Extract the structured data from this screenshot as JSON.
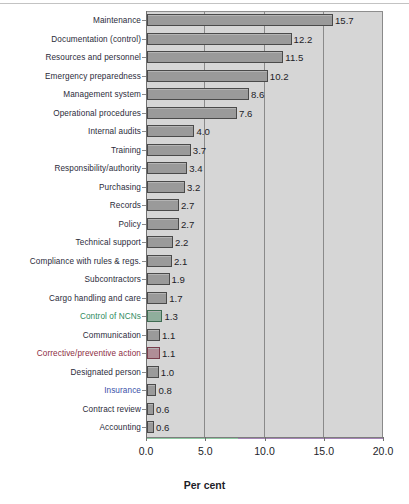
{
  "chart_data": {
    "type": "bar",
    "orientation": "horizontal",
    "title": "",
    "xlabel": "Per cent",
    "ylabel": "",
    "xlim": [
      0.0,
      20.0
    ],
    "xticks": [
      "0.0",
      "5.0",
      "10.0",
      "15.0",
      "20.0"
    ],
    "xtick_values": [
      0.0,
      5.0,
      10.0,
      15.0,
      20.0
    ],
    "grid": true,
    "legend": "none",
    "categories": [
      "Maintenance",
      "Documentation (control)",
      "Resources and personnel",
      "Emergency preparedness",
      "Management system",
      "Operational procedures",
      "Internal audits",
      "Training",
      "Responsibility/authority",
      "Purchasing",
      "Records",
      "Policy",
      "Technical support",
      "Compliance with rules & regs.",
      "Subcontractors",
      "Cargo handling and care",
      "Control of NCNs",
      "Communication",
      "Corrective/preventive action",
      "Designated person",
      "Insurance",
      "Contract review",
      "Accounting"
    ],
    "values": [
      15.7,
      12.2,
      11.5,
      10.2,
      8.6,
      7.6,
      4.0,
      3.7,
      3.4,
      3.2,
      2.7,
      2.7,
      2.2,
      2.1,
      1.9,
      1.7,
      1.3,
      1.1,
      1.1,
      1.0,
      0.8,
      0.6,
      0.6
    ],
    "value_labels": [
      "15.7",
      "12.2",
      "11.5",
      "10.2",
      "8.6",
      "7.6",
      "4.0",
      "3.7",
      "3.4",
      "3.2",
      "2.7",
      "2.7",
      "2.2",
      "2.1",
      "1.9",
      "1.7",
      "1.3",
      "1.1",
      "1.1",
      "1.0",
      "0.8",
      "0.6",
      "0.6"
    ],
    "label_colors": [
      "#2b2b3a",
      "#2b2b3a",
      "#2b2b3a",
      "#2b2b3a",
      "#2b2b3a",
      "#2b2b3a",
      "#2b2b3a",
      "#2b2b3a",
      "#2b2b3a",
      "#2b2b3a",
      "#2b2b3a",
      "#2b2b3a",
      "#2b2b3a",
      "#2b2b3a",
      "#2b2b3a",
      "#2b2b3a",
      "#2f8a5e",
      "#2b2b3a",
      "#8c2d3f",
      "#2b2b3a",
      "#3a4fa8",
      "#2b2b3a",
      "#2b2b3a"
    ],
    "bar_tints": [
      "",
      "",
      "",
      "",
      "",
      "",
      "",
      "",
      "",
      "",
      "",
      "",
      "",
      "",
      "",
      "",
      "green-tint",
      "",
      "red-tint",
      "",
      "",
      "",
      ""
    ],
    "colors": {
      "bar_fill": "#9a9a9a",
      "bar_border": "#4a4a4a",
      "plot_background": "#d6d6d6",
      "page_background": "#ffffff",
      "gridline": "#8a8a8a",
      "text": "#1d1d28",
      "accent_green": "#2f8a5e",
      "accent_red": "#8c2d3f",
      "accent_blue": "#3a4fa8"
    }
  }
}
